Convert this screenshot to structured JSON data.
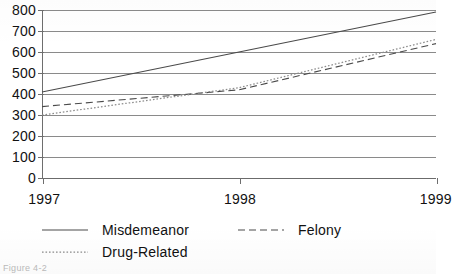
{
  "chart_data": {
    "type": "line",
    "title": "",
    "subtitle": "",
    "xlabel": "",
    "ylabel": "",
    "x": [
      1997,
      1998,
      1999
    ],
    "xticklabels": [
      "1997",
      "1998",
      "1999"
    ],
    "yticklabels": [
      "0",
      "100",
      "200",
      "300",
      "400",
      "500",
      "600",
      "700",
      "800"
    ],
    "yticks": [
      0,
      100,
      200,
      300,
      400,
      500,
      600,
      700,
      800
    ],
    "ylim": [
      0,
      800
    ],
    "xlim": [
      1997,
      1999
    ],
    "grid": "horizontal",
    "legend_position": "bottom-left",
    "series": [
      {
        "name": "Misdemeanor",
        "style": "solid",
        "color": "#4a4a4a",
        "values": [
          410,
          600,
          790
        ]
      },
      {
        "name": "Felony",
        "style": "dashed",
        "color": "#4a4a4a",
        "values": [
          340,
          420,
          640
        ]
      },
      {
        "name": "Drug-Related",
        "style": "dotted",
        "color": "#8c8c8c",
        "values": [
          300,
          430,
          660
        ]
      }
    ]
  },
  "legend": {
    "rows": [
      [
        {
          "label": "Misdemeanor",
          "style": "solid"
        },
        {
          "label": "Felony",
          "style": "dashed"
        }
      ],
      [
        {
          "label": "Drug-Related",
          "style": "dotted"
        }
      ]
    ]
  },
  "caption": {
    "text": "Figure 4-2"
  }
}
